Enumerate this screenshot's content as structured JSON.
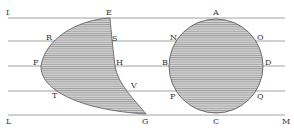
{
  "diagram": {
    "colors": {
      "line": "#8a8a8a",
      "fill": "#d2d2d2",
      "hatch": "#6e6e6e",
      "text": "#333333"
    },
    "parallel_lines_y": [
      18,
      41,
      66,
      91,
      115
    ],
    "labels": {
      "I": "I",
      "L": "L",
      "M": "M",
      "E": "E",
      "R": "R",
      "S": "S",
      "F": "F",
      "H": "H",
      "T": "T",
      "V": "V",
      "G": "G",
      "A": "A",
      "N": "N",
      "O": "O",
      "B": "B",
      "D": "D",
      "P": "P",
      "Q": "Q",
      "C": "C"
    }
  }
}
